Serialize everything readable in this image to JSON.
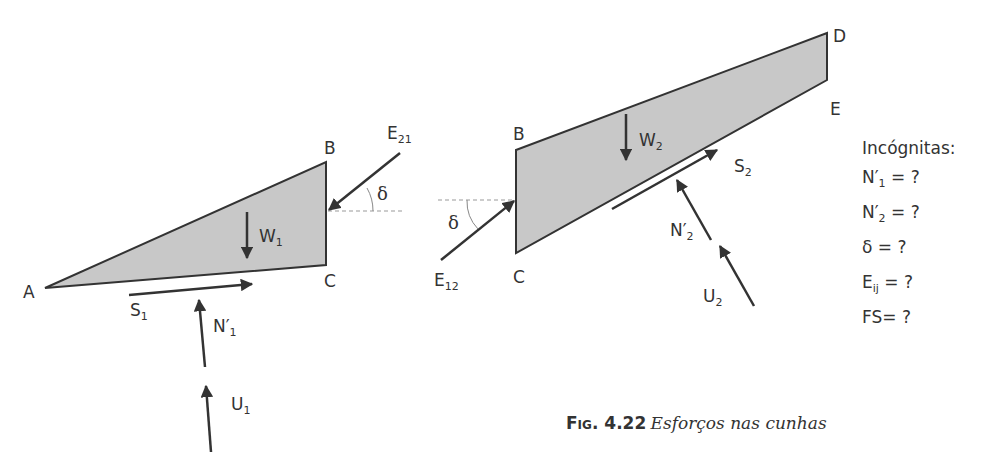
{
  "figure": {
    "colors": {
      "wedge_fill": "#c8c8c8",
      "stroke": "#333333",
      "dashed": "#999999"
    },
    "wedge1": {
      "vertices": {
        "A": "A",
        "B": "B",
        "C": "C"
      },
      "forces": {
        "weight": {
          "base": "W",
          "sub": "1"
        },
        "shear": {
          "base": "S",
          "sub": "1"
        },
        "normal": {
          "base": "N′",
          "sub": "1"
        },
        "uplift": {
          "base": "U",
          "sub": "1"
        },
        "interface": {
          "base": "E",
          "sub": "21"
        }
      },
      "angle": "δ"
    },
    "wedge2": {
      "vertices": {
        "B": "B",
        "C": "C",
        "D": "D",
        "E": "E"
      },
      "forces": {
        "weight": {
          "base": "W",
          "sub": "2"
        },
        "shear": {
          "base": "S",
          "sub": "2"
        },
        "normal": {
          "base": "N′",
          "sub": "2"
        },
        "uplift": {
          "base": "U",
          "sub": "2"
        },
        "interface": {
          "base": "E",
          "sub": "12"
        }
      },
      "angle": "δ"
    },
    "unknowns": {
      "title": "Incógnitas:",
      "items": [
        {
          "base": "N′",
          "sub": "1",
          "rest": " = ?"
        },
        {
          "base": "N′",
          "sub": "2",
          "rest": " = ?"
        },
        {
          "base": "δ",
          "sub": "",
          "rest": " = ?"
        },
        {
          "base": "E",
          "sub": "ij",
          "rest": " = ?"
        },
        {
          "base": "FS",
          "sub": "",
          "rest": "= ?"
        }
      ]
    },
    "caption": {
      "label": "Fig. 4.22",
      "text": "Esforços nas cunhas"
    }
  }
}
